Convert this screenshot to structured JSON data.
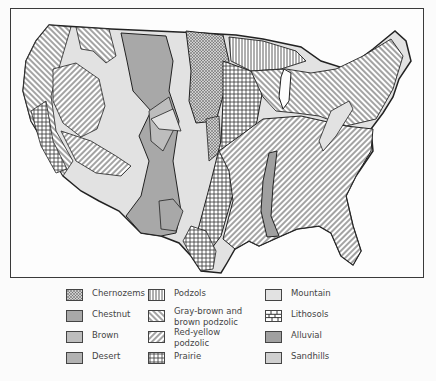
{
  "map": {
    "subject": "Great soil groups of the conterminous United States",
    "frame": {
      "left": 10,
      "top": 8,
      "width": 414,
      "height": 270
    }
  },
  "legend": {
    "items": [
      {
        "id": "chernozems",
        "label": "Chernozems",
        "pattern": "dots",
        "color": "#9a9a9a",
        "col": 0,
        "row": 0
      },
      {
        "id": "chestnut",
        "label": "Chestnut",
        "pattern": "solid",
        "color": "#a8a8a8",
        "col": 0,
        "row": 1
      },
      {
        "id": "brown",
        "label": "Brown",
        "pattern": "solid",
        "color": "#bdbdbd",
        "col": 0,
        "row": 2
      },
      {
        "id": "desert",
        "label": "Desert",
        "pattern": "solid",
        "color": "#b2b2b2",
        "col": 0,
        "row": 3
      },
      {
        "id": "podzols",
        "label": "Podzols",
        "pattern": "vertical-lines",
        "color": "#444444",
        "col": 1,
        "row": 0
      },
      {
        "id": "gray-brown-podzolic",
        "label": "Gray-brown and brown podzolic",
        "pattern": "diagonal-back",
        "color": "#444444",
        "col": 1,
        "row": 1
      },
      {
        "id": "red-yellow-podzolic",
        "label": "Red-yellow podzolic",
        "pattern": "diagonal-forward",
        "color": "#444444",
        "col": 1,
        "row": 2
      },
      {
        "id": "prairie",
        "label": "Prairie",
        "pattern": "grid",
        "color": "#444444",
        "col": 1,
        "row": 3
      },
      {
        "id": "mountain",
        "label": "Mountain",
        "pattern": "solid",
        "color": "#e2e2e2",
        "col": 2,
        "row": 0
      },
      {
        "id": "lithosols",
        "label": "Lithosols",
        "pattern": "brick",
        "color": "#333333",
        "col": 2,
        "row": 1
      },
      {
        "id": "alluvial",
        "label": "Alluvial",
        "pattern": "solid",
        "color": "#a0a0a0",
        "col": 2,
        "row": 2
      },
      {
        "id": "sandhills",
        "label": "Sandhills",
        "pattern": "solid",
        "color": "#cfcfcf",
        "col": 2,
        "row": 3
      }
    ]
  }
}
